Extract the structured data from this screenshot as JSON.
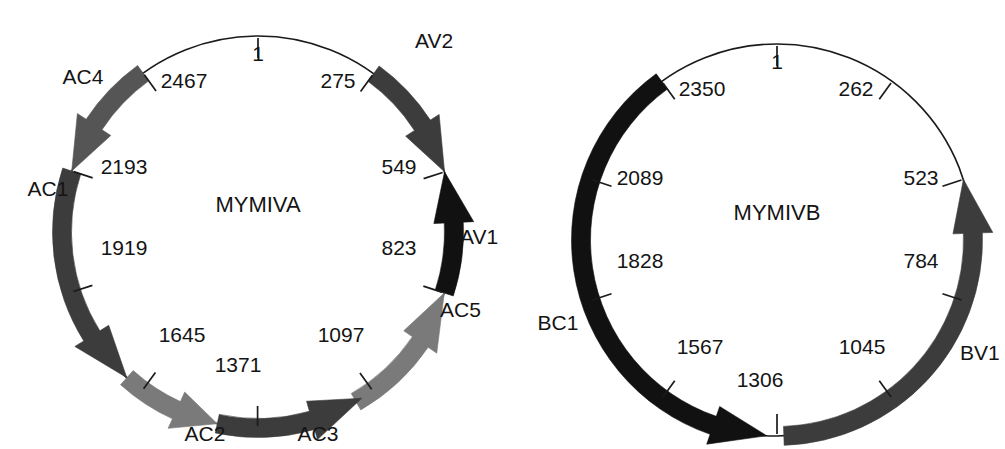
{
  "figure": {
    "type": "circular-genome-maps",
    "background_color": "#ffffff",
    "text_color": "#141414"
  },
  "palette": {
    "black": "#111111",
    "dark_gray": "#3c3c3c",
    "mid_gray": "#555555",
    "light_gray": "#7a7a7a",
    "outline": "#1a1a1a"
  },
  "maps": [
    {
      "id": "mymiva",
      "title": "MYMIVA",
      "center_x": 258,
      "center_y": 232,
      "radius": 196,
      "genome_length": 2740,
      "title_x": 258,
      "title_y": 212,
      "position_ticks": [
        {
          "label": "1",
          "value": 1,
          "angle_deg": 0,
          "lx": 258,
          "ly": 61,
          "anchor": "middle"
        },
        {
          "label": "275",
          "value": 275,
          "angle_deg": 36.13,
          "lx": 338,
          "ly": 88,
          "anchor": "middle"
        },
        {
          "label": "549",
          "value": 549,
          "angle_deg": 72.13,
          "lx": 399,
          "ly": 174,
          "anchor": "middle"
        },
        {
          "label": "823",
          "value": 823,
          "angle_deg": 108.13,
          "lx": 399,
          "ly": 255,
          "anchor": "middle"
        },
        {
          "label": "1097",
          "value": 1097,
          "angle_deg": 144.13,
          "lx": 341,
          "ly": 342,
          "anchor": "middle"
        },
        {
          "label": "1371",
          "value": 1371,
          "angle_deg": 180.13,
          "lx": 238,
          "ly": 372,
          "anchor": "middle"
        },
        {
          "label": "1645",
          "value": 1645,
          "angle_deg": 216.13,
          "lx": 182,
          "ly": 342,
          "anchor": "middle"
        },
        {
          "label": "1919",
          "value": 1919,
          "angle_deg": 252.13,
          "lx": 124,
          "ly": 255,
          "anchor": "middle"
        },
        {
          "label": "2193",
          "value": 2193,
          "angle_deg": 288.13,
          "lx": 124,
          "ly": 174,
          "anchor": "middle"
        },
        {
          "label": "2467",
          "value": 2467,
          "angle_deg": 324.13,
          "lx": 184,
          "ly": 88,
          "anchor": "middle"
        }
      ],
      "orfs": [
        {
          "name": "AV2",
          "start_angle": 36.13,
          "end_angle": 72.13,
          "direction": "clockwise",
          "color_key": "dark_gray",
          "label_x": 415,
          "label_y": 48,
          "label_anchor": "start"
        },
        {
          "name": "AV1",
          "start_angle": 72.13,
          "end_angle": 108.13,
          "direction": "counterclockwise",
          "color_key": "black",
          "label_x": 460,
          "label_y": 244,
          "label_anchor": "start"
        },
        {
          "name": "AC5",
          "start_angle": 108.13,
          "end_angle": 150.0,
          "direction": "counterclockwise",
          "color_key": "light_gray",
          "label_x": 440,
          "label_y": 317,
          "label_anchor": "start"
        },
        {
          "name": "AC3",
          "start_angle": 148.0,
          "end_angle": 192.0,
          "direction": "counterclockwise",
          "color_key": "dark_gray",
          "label_x": 318,
          "label_y": 441,
          "label_anchor": "middle"
        },
        {
          "name": "AC2",
          "start_angle": 192.0,
          "end_angle": 222.0,
          "direction": "counterclockwise",
          "color_key": "light_gray",
          "label_x": 205,
          "label_y": 441,
          "label_anchor": "middle"
        },
        {
          "name": "AC1",
          "start_angle": 222.0,
          "end_angle": 288.13,
          "direction": "counterclockwise",
          "color_key": "dark_gray",
          "label_x": 48,
          "label_y": 196,
          "label_anchor": "middle"
        },
        {
          "name": "AC4",
          "start_angle": 288.13,
          "end_angle": 324.13,
          "direction": "counterclockwise",
          "color_key": "mid_gray",
          "label_x": 83,
          "label_y": 84,
          "label_anchor": "middle"
        }
      ]
    },
    {
      "id": "mymivb",
      "title": "MYMIVB",
      "center_x": 777,
      "center_y": 240,
      "radius": 196,
      "genome_length": 2612,
      "title_x": 777,
      "title_y": 220,
      "position_ticks": [
        {
          "label": "1",
          "value": 1,
          "angle_deg": 0,
          "lx": 777,
          "ly": 69,
          "anchor": "middle"
        },
        {
          "label": "262",
          "value": 262,
          "angle_deg": 36.0,
          "lx": 856,
          "ly": 96,
          "anchor": "middle"
        },
        {
          "label": "523",
          "value": 523,
          "angle_deg": 72.0,
          "lx": 921,
          "ly": 185,
          "anchor": "middle"
        },
        {
          "label": "784",
          "value": 784,
          "angle_deg": 108.0,
          "lx": 921,
          "ly": 268,
          "anchor": "middle"
        },
        {
          "label": "1045",
          "value": 1045,
          "angle_deg": 144.0,
          "lx": 862,
          "ly": 354,
          "anchor": "middle"
        },
        {
          "label": "1306",
          "value": 1306,
          "angle_deg": 180.0,
          "lx": 760,
          "ly": 387,
          "anchor": "middle"
        },
        {
          "label": "1567",
          "value": 1567,
          "angle_deg": 216.0,
          "lx": 700,
          "ly": 354,
          "anchor": "middle"
        },
        {
          "label": "1828",
          "value": 1828,
          "angle_deg": 252.0,
          "lx": 640,
          "ly": 268,
          "anchor": "middle"
        },
        {
          "label": "2089",
          "value": 2089,
          "angle_deg": 288.0,
          "lx": 640,
          "ly": 185,
          "anchor": "middle"
        },
        {
          "label": "2350",
          "value": 2350,
          "angle_deg": 324.0,
          "lx": 702,
          "ly": 96,
          "anchor": "middle"
        }
      ],
      "orfs": [
        {
          "name": "BV1",
          "start_angle": 72.0,
          "end_angle": 178.0,
          "direction": "counterclockwise",
          "color_key": "dark_gray",
          "label_x": 960,
          "label_y": 360,
          "label_anchor": "start"
        },
        {
          "name": "BC1",
          "start_angle": 183.0,
          "end_angle": 324.0,
          "direction": "counterclockwise",
          "color_key": "black",
          "label_x": 558,
          "label_y": 330,
          "label_anchor": "middle"
        }
      ]
    }
  ]
}
